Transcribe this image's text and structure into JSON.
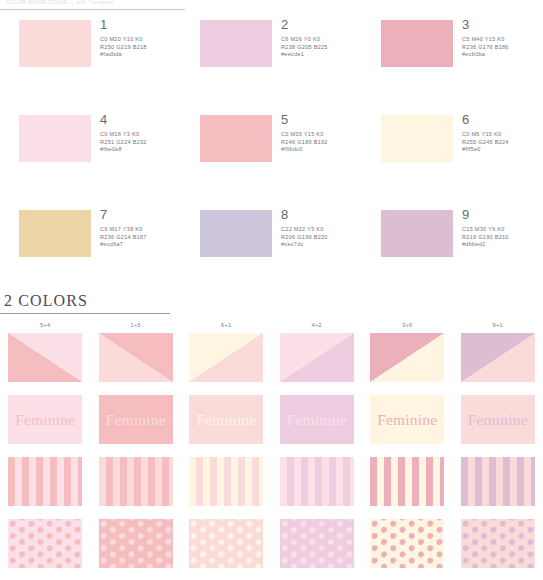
{
  "top_header": {
    "text": "COLOR IMAGE SCALE  —  soft / romantic",
    "rule_color": "#c9c9c9"
  },
  "palette": {
    "swatches": [
      {
        "num": "1",
        "cmyk": "C0 M20 Y10 K0",
        "rgb": "R250 G219 B218",
        "hex": "#fadbda"
      },
      {
        "num": "2",
        "cmyk": "C6 M26 Y0 K0",
        "rgb": "R238 G205 B225",
        "hex": "#eecde1"
      },
      {
        "num": "3",
        "cmyk": "C5 M40 Y15 K0",
        "rgb": "R236 G176 B186",
        "hex": "#ecb0ba"
      },
      {
        "num": "4",
        "cmyk": "C0 M18 Y3 K0",
        "rgb": "R251 G224 B232",
        "hex": "#fbe0e8"
      },
      {
        "num": "5",
        "cmyk": "C0 M35 Y15 K0",
        "rgb": "R246 G189 B192",
        "hex": "#f6bdc0"
      },
      {
        "num": "6",
        "cmyk": "C0 M5 Y15 K0",
        "rgb": "R255 G245 B224",
        "hex": "#fff5e0"
      },
      {
        "num": "7",
        "cmyk": "C9 M17 Y38 K0",
        "rgb": "R236 G214 B167",
        "hex": "#ecd6a7"
      },
      {
        "num": "8",
        "cmyk": "C22 M22 Y5 K0",
        "rgb": "R206 G199 B220",
        "hex": "#cec7dc"
      },
      {
        "num": "9",
        "cmyk": "C15 M30 Y6 K0",
        "rgb": "R219 G190 B210",
        "hex": "#dbbed2"
      }
    ]
  },
  "section2": {
    "title": "2 COLORS",
    "rule_color": "#9d9d9d",
    "word": "Feminine",
    "columns": [
      {
        "label": "5+4",
        "a": "#f6bdc0",
        "b": "#fbe0e8"
      },
      {
        "label": "1+5",
        "a": "#fadbda",
        "b": "#f6bdc0"
      },
      {
        "label": "6+1",
        "a": "#fff5e0",
        "b": "#fadbda"
      },
      {
        "label": "4+2",
        "a": "#fbe0e8",
        "b": "#eecde1"
      },
      {
        "label": "3+6",
        "a": "#ecb0ba",
        "b": "#fff5e0"
      },
      {
        "label": "9+1",
        "a": "#dbbed2",
        "b": "#fadbda"
      }
    ]
  }
}
